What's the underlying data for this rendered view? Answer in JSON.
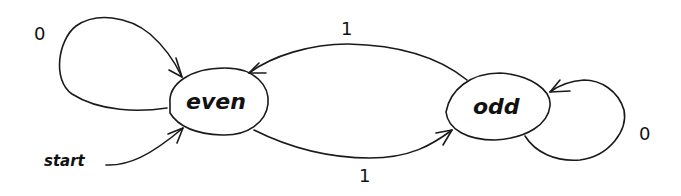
{
  "diagram": {
    "type": "finite-state-machine",
    "states": [
      {
        "id": "even",
        "label": "even",
        "initial": true
      },
      {
        "id": "odd",
        "label": "odd",
        "initial": false
      }
    ],
    "start_label": "start",
    "transitions": [
      {
        "from": "even",
        "to": "even",
        "label": "0"
      },
      {
        "from": "odd",
        "to": "even",
        "label": "1"
      },
      {
        "from": "even",
        "to": "odd",
        "label": "1"
      },
      {
        "from": "odd",
        "to": "odd",
        "label": "0"
      }
    ]
  }
}
